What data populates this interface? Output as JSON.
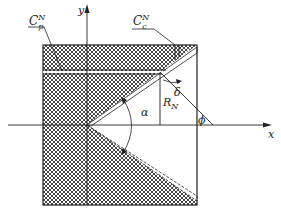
{
  "diagram": {
    "axes": {
      "x_label": "x",
      "y_label": "y"
    },
    "labels": {
      "cp": {
        "base": "C",
        "sub": "p",
        "sup": "N"
      },
      "cc": {
        "base": "C",
        "sub": "c",
        "sup": "N"
      },
      "rn": {
        "base": "R",
        "sub": "N"
      },
      "alpha": "α",
      "delta": "δ",
      "phi": "ϕ"
    },
    "colors": {
      "line": "#222222",
      "hatch": "#333333",
      "background": "#ffffff"
    }
  }
}
